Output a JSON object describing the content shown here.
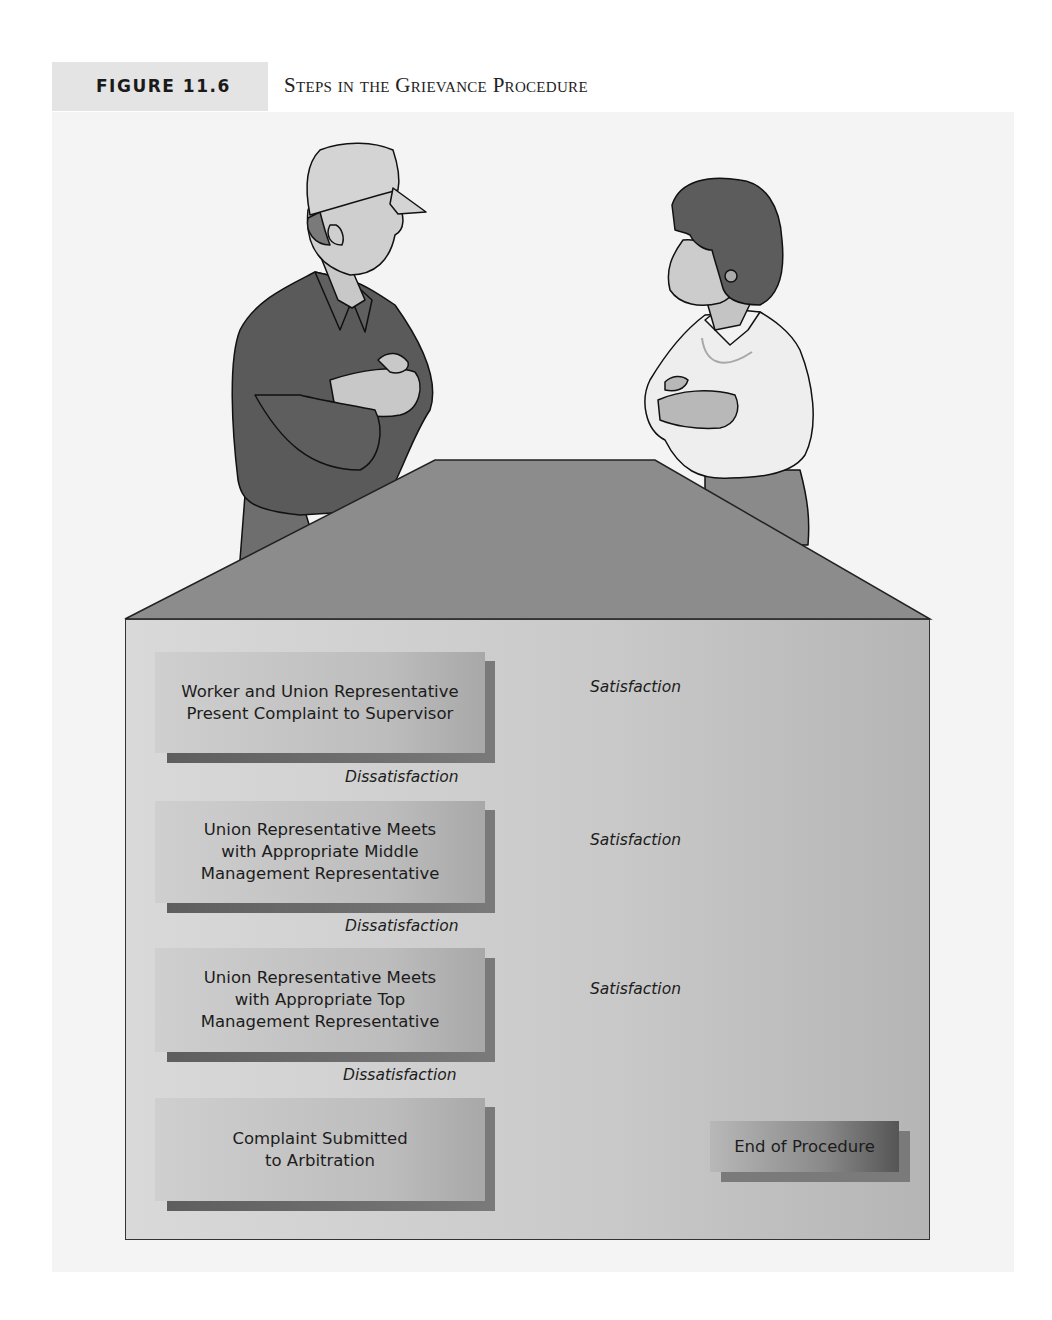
{
  "figure": {
    "label": "FIGURE 11.6",
    "title": "Steps in the Grievance Procedure"
  },
  "illustration": {
    "left_figure": "worker-in-cap-arms-crossed",
    "right_figure": "manager-woman-arms-crossed",
    "table": "meeting-table"
  },
  "flow": {
    "steps": [
      {
        "label": "Worker and Union Representative Present Complaint to Supervisor"
      },
      {
        "label": "Union Representative Meets with Appropriate Middle Management Representative"
      },
      {
        "label": "Union Representative Meets with Appropriate Top Management Representative"
      },
      {
        "label": "Complaint Submitted to Arbitration"
      }
    ],
    "step_lines": [
      [
        "Worker and Union Representative",
        "Present Complaint to Supervisor"
      ],
      [
        "Union Representative Meets",
        "with Appropriate Middle",
        "Management Representative"
      ],
      [
        "Union Representative Meets",
        "with Appropriate Top",
        "Management Representative"
      ],
      [
        "Complaint Submitted",
        "to Arbitration"
      ]
    ],
    "dissatisfaction_label": "Dissatisfaction",
    "satisfaction_label": "Satisfaction",
    "end_label": "End of Procedure",
    "edges": [
      {
        "from": 0,
        "to": 1,
        "label": "Dissatisfaction"
      },
      {
        "from": 1,
        "to": 2,
        "label": "Dissatisfaction"
      },
      {
        "from": 2,
        "to": 3,
        "label": "Dissatisfaction"
      },
      {
        "from": 0,
        "to": "end",
        "label": "Satisfaction"
      },
      {
        "from": 1,
        "to": "end",
        "label": "Satisfaction"
      },
      {
        "from": 2,
        "to": "end",
        "label": "Satisfaction"
      }
    ]
  },
  "colors": {
    "panel_bg": "#f4f4f4",
    "label_bg": "#e4e4e4",
    "box_fill": "#c4c4c4",
    "box_shadow": "#666666",
    "line": "#1a1a1a"
  }
}
